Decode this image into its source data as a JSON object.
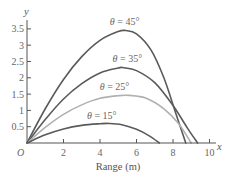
{
  "chart_data": {
    "type": "line",
    "title": "",
    "xlabel": "Range (m)",
    "ylabel": "y",
    "x_axis_symbol": "x",
    "origin_label": "O",
    "xlim": [
      0,
      10.3
    ],
    "ylim": [
      0,
      3.75
    ],
    "x_ticks": [
      2,
      4,
      6,
      8,
      10
    ],
    "x_tick_labels": [
      "2",
      "4",
      "6",
      "8",
      "10"
    ],
    "y_ticks": [
      0.5,
      1,
      1.5,
      2,
      2.5,
      3,
      3.5
    ],
    "y_tick_labels": [
      "0.5",
      "1",
      "1.5",
      "2",
      "2.5",
      "3",
      "3.5"
    ],
    "grid": false,
    "legend": "inline labels above each curve",
    "series": [
      {
        "name": "θ = 45°",
        "color": "#5a5a5a",
        "label_pos": [
          5.35,
          3.62
        ],
        "x": [
          0,
          1,
          2,
          3,
          4,
          5,
          5.4,
          6,
          6.8,
          7.5,
          8.1,
          8.7
        ],
        "y": [
          0,
          1.05,
          1.95,
          2.65,
          3.15,
          3.42,
          3.45,
          3.35,
          2.85,
          2.0,
          1.0,
          0
        ]
      },
      {
        "name": "θ = 35°",
        "color": "#5a5a5a",
        "label_pos": [
          5.5,
          2.5
        ],
        "x": [
          0,
          1,
          2,
          3,
          4,
          5,
          5.3,
          6,
          7,
          8,
          8.8,
          9.35
        ],
        "y": [
          0,
          0.72,
          1.35,
          1.82,
          2.15,
          2.3,
          2.31,
          2.22,
          1.85,
          1.15,
          0.45,
          0
        ]
      },
      {
        "name": "θ = 25°",
        "color": "#b0b0b0",
        "label_pos": [
          4.8,
          1.62
        ],
        "x": [
          0,
          1,
          2,
          3,
          4,
          5,
          5.6,
          6.5,
          7.5,
          8.3,
          9.0
        ],
        "y": [
          0,
          0.48,
          0.88,
          1.17,
          1.37,
          1.45,
          1.46,
          1.38,
          1.05,
          0.6,
          0
        ]
      },
      {
        "name": "θ = 15°",
        "color": "#5a5a5a",
        "label_pos": [
          4.1,
          0.75
        ],
        "x": [
          0,
          1,
          2,
          3,
          4,
          4.5,
          5.2,
          6,
          6.7,
          7.25
        ],
        "y": [
          0,
          0.25,
          0.43,
          0.54,
          0.59,
          0.6,
          0.56,
          0.42,
          0.22,
          0
        ]
      }
    ]
  }
}
